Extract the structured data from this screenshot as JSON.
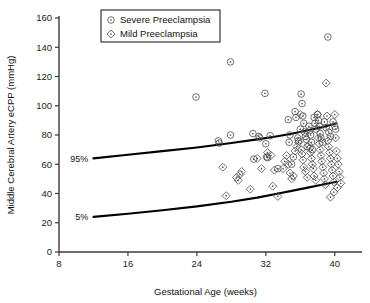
{
  "chart_data": {
    "type": "scatter",
    "title": "",
    "xlabel": "Gestational Age (weeks)",
    "ylabel": "Middle Cerebral Artery eCPP (mmHg)",
    "xlim": [
      8,
      42
    ],
    "ylim": [
      0,
      160
    ],
    "xticks": [
      8,
      16,
      24,
      32,
      40
    ],
    "yticks": [
      0,
      20,
      40,
      60,
      80,
      100,
      120,
      140,
      160
    ],
    "grid": false,
    "legend_position": "top-left",
    "legend": [
      {
        "name": "Severe Preeclampsia",
        "marker": "circle-dot"
      },
      {
        "name": "Mild Preeclampsia",
        "marker": "diamond-dot"
      }
    ],
    "annotations": [
      {
        "text": "95%",
        "x": 11.4,
        "y": 64
      },
      {
        "text": "5%",
        "x": 11.4,
        "y": 24
      }
    ],
    "reference_curves": [
      {
        "name": "95%",
        "x": [
          12,
          16,
          20,
          24,
          28,
          31,
          33,
          35,
          37,
          38.5,
          39.5,
          40.2
        ],
        "y": [
          64,
          66.5,
          69,
          71.5,
          74.5,
          77,
          78.8,
          80.8,
          83.4,
          85.3,
          86.8,
          88
        ]
      },
      {
        "name": "5%",
        "x": [
          12,
          16,
          20,
          24,
          28,
          31,
          33,
          35,
          37,
          38.5,
          39.5,
          40.2
        ],
        "y": [
          24,
          26.2,
          28.6,
          31.2,
          34.4,
          37.2,
          39.5,
          41.8,
          44.2,
          46.0,
          47.2,
          48
        ]
      }
    ],
    "series": [
      {
        "name": "Severe Preeclampsia",
        "marker": "circle-dot",
        "points": [
          [
            23.9,
            106
          ],
          [
            26.5,
            76
          ],
          [
            26.6,
            74.5
          ],
          [
            27.9,
            130
          ],
          [
            27.9,
            80
          ],
          [
            30.5,
            81
          ],
          [
            30.6,
            63.5
          ],
          [
            31.2,
            79
          ],
          [
            31.3,
            78
          ],
          [
            31.9,
            108.5
          ],
          [
            32.0,
            74
          ],
          [
            32.1,
            65
          ],
          [
            32.2,
            64.5
          ],
          [
            32.5,
            79.5
          ],
          [
            33.4,
            57
          ],
          [
            34.6,
            90.5
          ],
          [
            34.7,
            75
          ],
          [
            34.8,
            80
          ],
          [
            35.0,
            60
          ],
          [
            35.2,
            65
          ],
          [
            35.4,
            96
          ],
          [
            35.5,
            92
          ],
          [
            35.7,
            78
          ],
          [
            35.8,
            76
          ],
          [
            36.0,
            84
          ],
          [
            36.1,
            108
          ],
          [
            36.2,
            101.5
          ],
          [
            36.3,
            93
          ],
          [
            36.4,
            88
          ],
          [
            36.5,
            82
          ],
          [
            36.6,
            79
          ],
          [
            36.7,
            77
          ],
          [
            36.8,
            72
          ],
          [
            37.0,
            86
          ],
          [
            37.1,
            83
          ],
          [
            37.2,
            80
          ],
          [
            37.3,
            75
          ],
          [
            37.4,
            70
          ],
          [
            37.6,
            92
          ],
          [
            37.7,
            88
          ],
          [
            37.8,
            84
          ],
          [
            38.0,
            94
          ],
          [
            38.1,
            90
          ],
          [
            38.2,
            86
          ],
          [
            38.3,
            81
          ],
          [
            38.4,
            78
          ],
          [
            38.6,
            75
          ],
          [
            38.8,
            89
          ],
          [
            39.0,
            85
          ],
          [
            39.2,
            147
          ],
          [
            39.3,
            82
          ],
          [
            39.5,
            79
          ],
          [
            39.8,
            89
          ],
          [
            40.0,
            86
          ],
          [
            40.1,
            84
          ]
        ]
      },
      {
        "name": "Mild Preeclampsia",
        "marker": "diamond-dot",
        "points": [
          [
            27.0,
            58
          ],
          [
            27.4,
            38.5
          ],
          [
            28.6,
            51
          ],
          [
            28.8,
            49
          ],
          [
            29.0,
            53
          ],
          [
            29.2,
            55
          ],
          [
            30.2,
            43
          ],
          [
            31.0,
            64
          ],
          [
            31.5,
            57
          ],
          [
            32.2,
            68
          ],
          [
            32.6,
            66
          ],
          [
            32.8,
            45
          ],
          [
            33.4,
            38
          ],
          [
            34.0,
            57
          ],
          [
            34.2,
            62
          ],
          [
            34.4,
            66
          ],
          [
            34.6,
            60
          ],
          [
            34.8,
            54
          ],
          [
            35.0,
            50
          ],
          [
            35.2,
            52
          ],
          [
            35.4,
            69
          ],
          [
            35.6,
            72
          ],
          [
            35.8,
            75
          ],
          [
            36.0,
            94
          ],
          [
            36.1,
            70
          ],
          [
            36.2,
            67
          ],
          [
            36.3,
            63
          ],
          [
            36.4,
            58
          ],
          [
            36.6,
            55
          ],
          [
            36.8,
            51
          ],
          [
            37.0,
            73
          ],
          [
            37.1,
            71
          ],
          [
            37.2,
            68
          ],
          [
            37.3,
            64
          ],
          [
            37.4,
            60
          ],
          [
            37.5,
            57
          ],
          [
            37.6,
            52
          ],
          [
            37.8,
            49
          ],
          [
            38.0,
            94
          ],
          [
            38.1,
            78
          ],
          [
            38.2,
            74
          ],
          [
            38.3,
            70
          ],
          [
            38.4,
            66
          ],
          [
            38.5,
            62
          ],
          [
            38.6,
            58
          ],
          [
            38.7,
            54
          ],
          [
            38.8,
            50
          ],
          [
            38.9,
            46
          ],
          [
            39.0,
            115.5
          ],
          [
            39.1,
            93
          ],
          [
            39.2,
            76
          ],
          [
            39.3,
            72
          ],
          [
            39.4,
            68
          ],
          [
            39.5,
            64
          ],
          [
            39.6,
            60
          ],
          [
            39.7,
            56
          ],
          [
            39.8,
            52
          ],
          [
            39.9,
            48
          ],
          [
            39.9,
            41
          ],
          [
            39.5,
            37.5
          ],
          [
            40.0,
            94
          ],
          [
            40.1,
            78
          ],
          [
            40.2,
            69
          ],
          [
            40.3,
            64
          ],
          [
            40.4,
            60
          ],
          [
            40.5,
            55
          ],
          [
            40.6,
            51
          ],
          [
            40.7,
            47
          ],
          [
            40.3,
            44
          ],
          [
            33.0,
            56
          ]
        ]
      }
    ]
  }
}
